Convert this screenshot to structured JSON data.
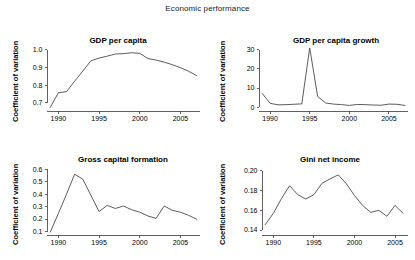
{
  "figure": {
    "title": "Economic performance",
    "shared_ylabel": "Coefficient of variation"
  },
  "chart_data": [
    {
      "type": "line",
      "title": "GDP per capita",
      "xlabel": "",
      "ylabel": "Coefficient of variation",
      "xlim": [
        1988.6,
        2007.4
      ],
      "ylim": [
        0.66,
        1.02
      ],
      "xticks": [
        1990,
        1995,
        2000,
        2005
      ],
      "yticks": [
        0.7,
        0.8,
        0.9,
        1.0
      ],
      "ytick_labels": [
        "0.7",
        "0.8",
        "0.9",
        "1.0"
      ],
      "xtick_labels": [
        "1990",
        "1995",
        "2000",
        "2005"
      ],
      "grid": false,
      "legend": "none",
      "x": [
        1989,
        1990,
        1991,
        1992,
        1993,
        1994,
        1995,
        1996,
        1997,
        1998,
        1999,
        2000,
        2001,
        2002,
        2003,
        2004,
        2005,
        2006,
        2007
      ],
      "values": [
        0.675,
        0.757,
        0.763,
        0.822,
        0.879,
        0.937,
        0.952,
        0.963,
        0.975,
        0.977,
        0.982,
        0.979,
        0.949,
        0.941,
        0.929,
        0.915,
        0.898,
        0.878,
        0.853
      ]
    },
    {
      "type": "line",
      "title": "GDP per capita growth",
      "xlabel": "",
      "ylabel": "Coefficient of variation",
      "xlim": [
        1988.6,
        2007.4
      ],
      "ylim": [
        -1.5,
        32
      ],
      "xticks": [
        1990,
        1995,
        2000,
        2005
      ],
      "yticks": [
        0,
        10,
        20,
        30
      ],
      "ytick_labels": [
        "0",
        "10",
        "20",
        "30"
      ],
      "xtick_labels": [
        "1990",
        "1995",
        "2000",
        "2005"
      ],
      "grid": false,
      "legend": "none",
      "x": [
        1989,
        1990,
        1991,
        1992,
        1993,
        1994,
        1995,
        1996,
        1997,
        1998,
        1999,
        2000,
        2001,
        2002,
        2003,
        2004,
        2005,
        2006,
        2007
      ],
      "values": [
        7.2,
        2.0,
        1.2,
        1.3,
        1.5,
        1.7,
        31.0,
        5.6,
        2.2,
        1.6,
        1.3,
        0.9,
        1.4,
        1.3,
        1.1,
        1.0,
        1.6,
        1.5,
        0.9
      ]
    },
    {
      "type": "line",
      "title": "Gross capital formation",
      "xlabel": "",
      "ylabel": "Coefficient of variation",
      "xlim": [
        1988.6,
        2007.4
      ],
      "ylim": [
        0.08,
        0.61
      ],
      "xticks": [
        1990,
        1995,
        2000,
        2005
      ],
      "yticks": [
        0.1,
        0.2,
        0.3,
        0.4,
        0.5,
        0.6
      ],
      "ytick_labels": [
        "0.1",
        "0.2",
        "0.3",
        "0.4",
        "0.5",
        "0.6"
      ],
      "xtick_labels": [
        "1990",
        "1995",
        "2000",
        "2005"
      ],
      "grid": false,
      "legend": "none",
      "x": [
        1989,
        1990,
        1991,
        1992,
        1993,
        1994,
        1995,
        1996,
        1997,
        1998,
        1999,
        2000,
        2001,
        2002,
        2003,
        2004,
        2005,
        2006,
        2007
      ],
      "values": [
        0.095,
        0.245,
        0.4,
        0.56,
        0.52,
        0.39,
        0.26,
        0.31,
        0.285,
        0.305,
        0.275,
        0.255,
        0.225,
        0.205,
        0.305,
        0.27,
        0.255,
        0.23,
        0.198
      ]
    },
    {
      "type": "line",
      "title": "Gini net income",
      "xlabel": "",
      "ylabel": "Coefficient of variation",
      "xlim": [
        1988.6,
        2006.6
      ],
      "ylim": [
        0.136,
        0.203
      ],
      "xticks": [
        1990,
        1995,
        2000,
        2005
      ],
      "yticks": [
        0.14,
        0.16,
        0.18,
        0.2
      ],
      "ytick_labels": [
        "0.14",
        "0.16",
        "0.18",
        "0.20"
      ],
      "xtick_labels": [
        "1990",
        "1995",
        "2000",
        "2005"
      ],
      "grid": false,
      "legend": "none",
      "x": [
        1989,
        1990,
        1991,
        1992,
        1993,
        1994,
        1995,
        1996,
        1997,
        1998,
        1999,
        2000,
        2001,
        2002,
        2003,
        2004,
        2005,
        2006
      ],
      "values": [
        0.1455,
        0.157,
        0.172,
        0.185,
        0.176,
        0.1715,
        0.176,
        0.1875,
        0.192,
        0.196,
        0.187,
        0.175,
        0.165,
        0.158,
        0.16,
        0.154,
        0.165,
        0.157
      ]
    }
  ]
}
